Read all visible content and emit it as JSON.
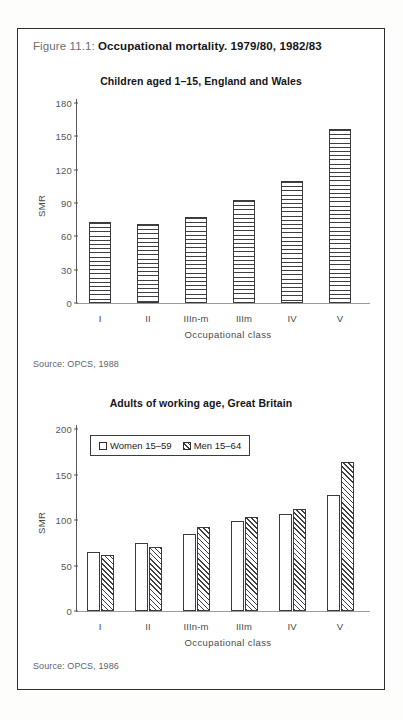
{
  "caption": {
    "label": "Figure 11.1:",
    "title": "Occupational mortality. 1979/80, 1982/83"
  },
  "chart_data": [
    {
      "type": "bar",
      "title": "Children aged 1–15, England and Wales",
      "xlabel": "Occupational class",
      "ylabel": "SMR",
      "categories": [
        "I",
        "II",
        "IIIn-m",
        "IIIm",
        "IV",
        "V"
      ],
      "values": [
        73,
        71,
        77,
        93,
        110,
        157
      ],
      "yticks": [
        0,
        30,
        60,
        90,
        120,
        150,
        180
      ],
      "ylim": [
        0,
        180
      ],
      "grid": false,
      "legend": null,
      "source": "Source: OPCS, 1988",
      "bar_fill": "horizontal-hatch"
    },
    {
      "type": "bar",
      "title": "Adults of working age, Great Britain",
      "xlabel": "Occupational class",
      "ylabel": "SMR",
      "categories": [
        "I",
        "II",
        "IIIn-m",
        "IIIm",
        "IV",
        "V"
      ],
      "series": [
        {
          "name": "Women 15–59",
          "values": [
            65,
            75,
            85,
            99,
            107,
            128
          ],
          "fill": "white"
        },
        {
          "name": "Men 15–64",
          "values": [
            62,
            70,
            92,
            103,
            112,
            164
          ],
          "fill": "diagonal-hatch"
        }
      ],
      "yticks": [
        0,
        50,
        100,
        150,
        200
      ],
      "ylim": [
        0,
        200
      ],
      "grid": false,
      "legend_position": "top-left-inside",
      "source": "Source: OPCS, 1986"
    }
  ],
  "colors": {
    "frame": "#2f2f33",
    "ink": "#3f3f44",
    "axis": "#55555a",
    "caption_label": "#6d6d70",
    "background": "#ffffff"
  }
}
